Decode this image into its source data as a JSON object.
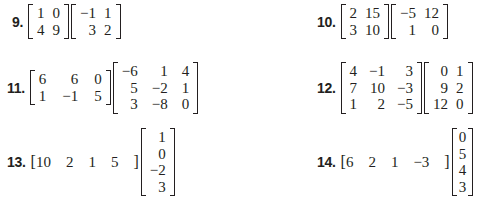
{
  "problems": [
    {
      "number": "9.",
      "matrices": [
        {
          "rows": [
            [
              "1",
              "0"
            ],
            [
              "4",
              "9"
            ]
          ]
        },
        {
          "rows": [
            [
              "−1",
              "1"
            ],
            [
              "3",
              "2"
            ]
          ]
        }
      ]
    },
    {
      "number": "10.",
      "matrices": [
        {
          "rows": [
            [
              "2",
              "15"
            ],
            [
              "3",
              "10"
            ]
          ]
        },
        {
          "rows": [
            [
              "−5",
              "12"
            ],
            [
              "1",
              "0"
            ]
          ]
        }
      ]
    },
    {
      "number": "11.",
      "matrices": [
        {
          "rows": [
            [
              "6",
              "6",
              "0"
            ],
            [
              "1",
              "−1",
              "5"
            ]
          ]
        },
        {
          "rows": [
            [
              "−6",
              "1",
              "4"
            ],
            [
              "5",
              "−2",
              "1"
            ],
            [
              "3",
              "−8",
              "0"
            ]
          ]
        }
      ]
    },
    {
      "number": "12.",
      "matrices": [
        {
          "rows": [
            [
              "4",
              "−1",
              "3"
            ],
            [
              "7",
              "10",
              "−3"
            ],
            [
              "1",
              "2",
              "−5"
            ]
          ]
        },
        {
          "rows": [
            [
              "0",
              "1"
            ],
            [
              "9",
              "2"
            ],
            [
              "12",
              "0"
            ]
          ]
        }
      ]
    },
    {
      "number": "13.",
      "row_vector": [
        "10",
        "2",
        "1",
        "5"
      ],
      "column_vector": [
        "1",
        "0",
        "−2",
        "3"
      ]
    },
    {
      "number": "14.",
      "row_vector": [
        "6",
        "2",
        "1",
        "−3"
      ],
      "column_vector": [
        "0",
        "5",
        "4",
        "3"
      ]
    }
  ],
  "brackets": {
    "open": "[",
    "close": "]"
  }
}
